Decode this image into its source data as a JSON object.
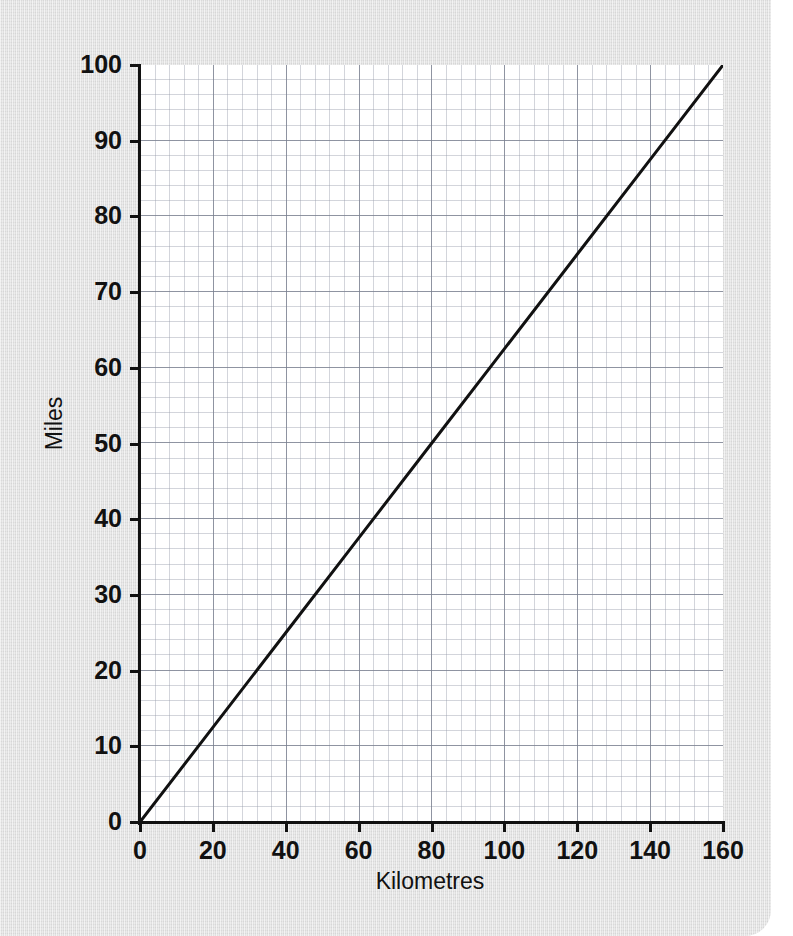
{
  "background": {
    "paper_color": "#dedede",
    "plot_color": "#ffffff",
    "ink_color": "#111111",
    "grid_color": "#9aa0ae"
  },
  "chart_data": {
    "type": "line",
    "title": "",
    "subtitle": "",
    "xlabel": "Kilometres",
    "ylabel": "Miles",
    "xlim": [
      0,
      160
    ],
    "ylim": [
      0,
      100
    ],
    "xticks": [
      0,
      20,
      40,
      60,
      80,
      100,
      120,
      140,
      160
    ],
    "yticks": [
      0,
      10,
      20,
      30,
      40,
      50,
      60,
      70,
      80,
      90,
      100
    ],
    "xticklabels": [
      "0",
      "20",
      "40",
      "60",
      "80",
      "100",
      "120",
      "140",
      "160"
    ],
    "yticklabels": [
      "0",
      "10",
      "20",
      "30",
      "40",
      "50",
      "60",
      "70",
      "80",
      "90",
      "100"
    ],
    "grid": true,
    "grid_minor": true,
    "legend": false,
    "legend_position": "none",
    "annotations": [],
    "series": [
      {
        "name": "Kilometres to Miles conversion",
        "color": "#111111",
        "linewidth": 3,
        "x": [
          0,
          20,
          40,
          60,
          80,
          100,
          120,
          140,
          160
        ],
        "values": [
          0,
          12.5,
          25,
          37.5,
          50,
          62.5,
          75,
          87.5,
          100
        ]
      }
    ]
  }
}
